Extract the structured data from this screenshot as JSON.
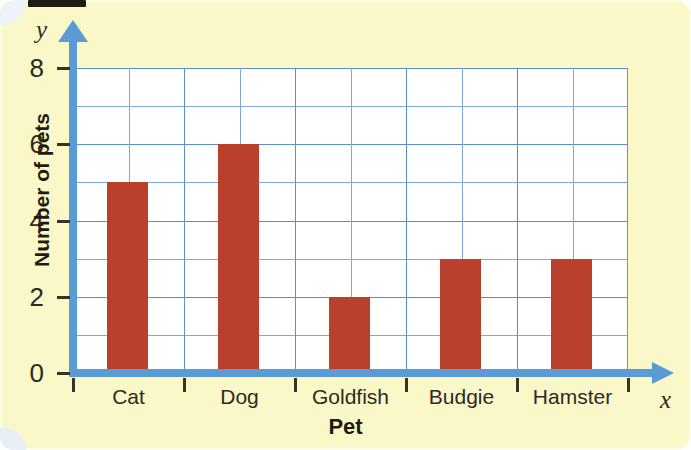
{
  "chart_data": {
    "type": "bar",
    "title": "",
    "xlabel": "Pet",
    "ylabel": "Number of pets",
    "categories": [
      "Cat",
      "Dog",
      "Goldfish",
      "Budgie",
      "Hamster"
    ],
    "values": [
      5,
      6,
      2,
      3,
      3
    ],
    "ylim": [
      0,
      8
    ],
    "ytick_labels": [
      "0",
      "2",
      "4",
      "6",
      "8"
    ],
    "ytick_values": [
      0,
      2,
      4,
      6,
      8
    ],
    "y_minor_step": 1,
    "grid": true,
    "legend": null,
    "axis_letters": {
      "x": "x",
      "y": "y"
    },
    "colors": {
      "bar": "#b8402c",
      "axis": "#5b9bd5",
      "grid_minor": "#7fa9dd",
      "grid_major": "#5b8fd0",
      "plot_background": "#ffffff",
      "page_background": "#faf8c8",
      "text": "#2e2a1e"
    }
  }
}
